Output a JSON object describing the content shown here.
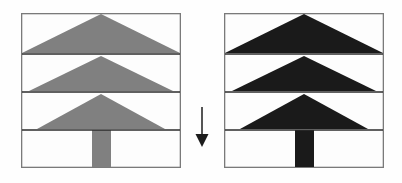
{
  "figure": {
    "caption": "",
    "background_color": "#fefefe"
  },
  "colors": {
    "frame_border": "#7a7a7a",
    "band_rule": "#2b2b2b",
    "panel_background": "#fdfdfd",
    "tree_gray": "#808080",
    "tree_black": "#1a1a1a",
    "arrow": "#1c1c1c"
  },
  "geometry": {
    "panel_width": 160,
    "panel_height": 155,
    "band_rule_y": [
      41,
      79,
      117
    ],
    "apex_x": 80,
    "trunk": {
      "x": 71,
      "width": 19
    },
    "triangle_half_widths": [
      80,
      72,
      64
    ]
  },
  "panels": [
    {
      "id": "left",
      "name": "original-tree-panel",
      "label": "",
      "fill_name": "gray",
      "fill_color": "#808080",
      "shapes": [
        {
          "name": "canopy-tier-1",
          "type": "triangle",
          "apex_y": 0,
          "base_y": 41
        },
        {
          "name": "canopy-tier-2",
          "type": "triangle",
          "apex_y": 41,
          "base_y": 79
        },
        {
          "name": "canopy-tier-3",
          "type": "triangle",
          "apex_y": 79,
          "base_y": 117
        },
        {
          "name": "trunk",
          "type": "rectangle",
          "top_y": 117,
          "bottom_y": 155
        }
      ]
    },
    {
      "id": "right",
      "name": "darkened-tree-panel",
      "label": "",
      "fill_name": "black",
      "fill_color": "#1a1a1a",
      "shapes": [
        {
          "name": "canopy-tier-1",
          "type": "triangle",
          "apex_y": 0,
          "base_y": 41
        },
        {
          "name": "canopy-tier-2",
          "type": "triangle",
          "apex_y": 41,
          "base_y": 79
        },
        {
          "name": "canopy-tier-3",
          "type": "triangle",
          "apex_y": 79,
          "base_y": 117
        },
        {
          "name": "trunk",
          "type": "rectangle",
          "top_y": 117,
          "bottom_y": 155
        }
      ]
    }
  ],
  "arrow": {
    "name": "transformation-arrow",
    "direction": "down",
    "label": ""
  }
}
